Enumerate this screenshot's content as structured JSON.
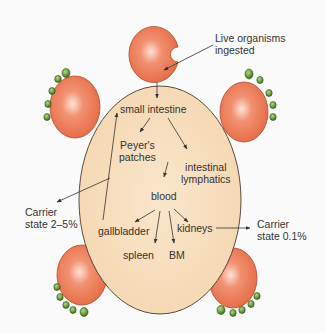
{
  "colors": {
    "background": "#fbfbfb",
    "body_fill": "#f8dcb8",
    "body_stroke": "#4a3a30",
    "cell_fill": "#ec7a55",
    "cell_highlight": "#fbd0bd",
    "cell_stroke": "#b24a2c",
    "bacteria_fill": "#6a9a3a",
    "bacteria_stroke": "#2f5a1c",
    "arrow": "#333333",
    "text": "#333333"
  },
  "labels": {
    "live_organisms_line1": "Live organisms",
    "live_organisms_line2": "ingested",
    "small_intestine": "small intestine",
    "peyers_line1": "Peyer's",
    "peyers_line2": "patches",
    "intestinal_line1": "intestinal",
    "intestinal_line2": "lymphatics",
    "blood": "blood",
    "gallbladder": "gallbladder",
    "kidneys": "kidneys",
    "spleen": "spleen",
    "bm": "BM",
    "carrier_left_line1": "Carrier",
    "carrier_left_line2": "state 2–5%",
    "carrier_right_line1": "Carrier",
    "carrier_right_line2": "state 0.1%"
  },
  "flow_edges": [
    [
      "Live organisms ingested",
      "small intestine"
    ],
    [
      "small intestine",
      "Peyer's patches"
    ],
    [
      "small intestine",
      "intestinal lymphatics"
    ],
    [
      "Peyer's patches / intestinal lymphatics",
      "blood"
    ],
    [
      "blood",
      "gallbladder"
    ],
    [
      "blood",
      "spleen"
    ],
    [
      "blood",
      "BM"
    ],
    [
      "blood",
      "kidneys"
    ],
    [
      "gallbladder",
      "small intestine"
    ],
    [
      "gallbladder",
      "Carrier state 2–5%"
    ],
    [
      "kidneys",
      "Carrier state 0.1%"
    ]
  ]
}
